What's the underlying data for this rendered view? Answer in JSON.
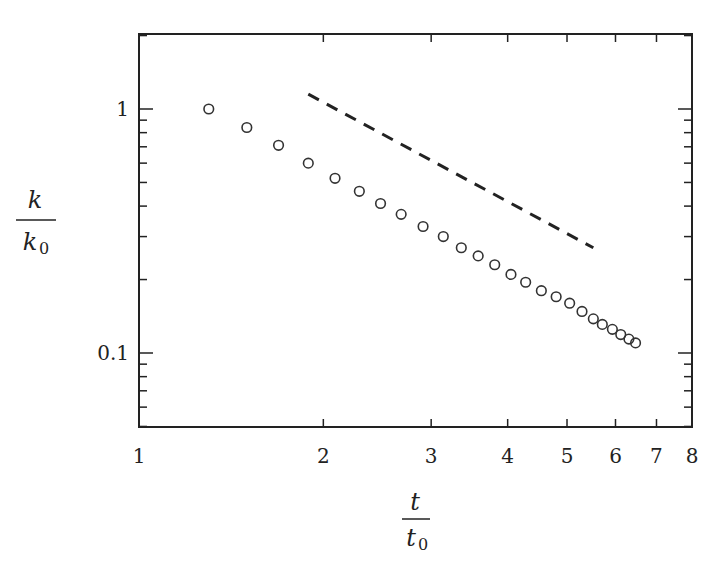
{
  "chart_data": {
    "type": "scatter",
    "title": "",
    "xlabel": "t / t0",
    "ylabel": "k / k0",
    "x_scale": "log",
    "y_scale": "log",
    "xlim": [
      1,
      8
    ],
    "ylim": [
      0.05,
      1.3
    ],
    "x_ticks": [
      "1",
      "2",
      "3",
      "4",
      "5",
      "6",
      "7",
      "8"
    ],
    "y_ticks": [
      "1",
      "0.1"
    ],
    "grid": false,
    "legend": null,
    "series": [
      {
        "name": "data",
        "marker": "open-circle",
        "x": [
          1.3,
          1.5,
          1.69,
          1.89,
          2.09,
          2.29,
          2.48,
          2.68,
          2.91,
          3.14,
          3.36,
          3.58,
          3.81,
          4.05,
          4.28,
          4.54,
          4.8,
          5.05,
          5.29,
          5.52,
          5.71,
          5.93,
          6.12,
          6.31,
          6.47
        ],
        "y": [
          1.0,
          0.84,
          0.71,
          0.6,
          0.52,
          0.46,
          0.41,
          0.37,
          0.33,
          0.3,
          0.27,
          0.25,
          0.23,
          0.21,
          0.195,
          0.18,
          0.17,
          0.16,
          0.148,
          0.138,
          0.131,
          0.125,
          0.119,
          0.114,
          0.11
        ]
      },
      {
        "name": "reference slope",
        "style": "dashed",
        "x": [
          1.89,
          5.52
        ],
        "y": [
          1.15,
          0.27
        ]
      }
    ]
  },
  "labels": {
    "y_numerator": "k",
    "y_denominator": "k",
    "y_denominator_sub": "0",
    "x_numerator": "t",
    "x_denominator": "t",
    "x_denominator_sub": "0"
  }
}
